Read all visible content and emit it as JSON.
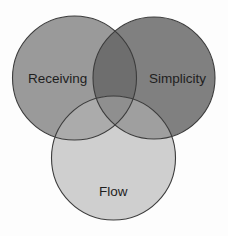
{
  "diagram": {
    "type": "venn",
    "sets": [
      {
        "id": "receiving",
        "label": "Receiving",
        "center": [
          74.5,
          78
        ],
        "radius": 62,
        "fill": "#9a9a9a"
      },
      {
        "id": "simplicity",
        "label": "Simplicity",
        "center": [
          154,
          78
        ],
        "radius": 61,
        "fill": "#808080"
      },
      {
        "id": "flow",
        "label": "Flow",
        "center": [
          113.5,
          158
        ],
        "radius": 62,
        "fill": "#cfcfcf"
      }
    ],
    "overlaps": {
      "receiving_simplicity": "#6e6e6e",
      "receiving_flow": "#ababab",
      "simplicity_flow": "#9f9f9f",
      "all_three": "#8f8f8f"
    },
    "stroke": "#3c3c3c",
    "labels": {
      "receiving": "Receiving",
      "simplicity": "Simplicity",
      "flow": "Flow"
    }
  }
}
